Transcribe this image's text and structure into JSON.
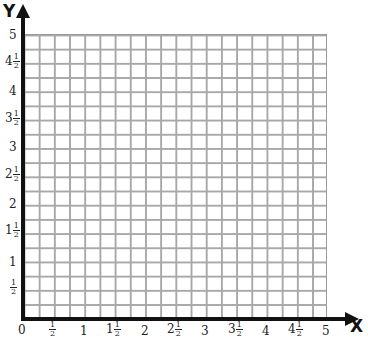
{
  "axes": {
    "x_label": "X",
    "y_label": "Y",
    "origin_label": "0"
  },
  "grid": {
    "columns": 20,
    "rows": 20,
    "x_range": [
      0,
      5
    ],
    "y_range": [
      0,
      5
    ],
    "cell_value": 0.25,
    "line_color": "#a8a8a8",
    "axis_color": "#111111"
  },
  "x_ticks": [
    {
      "whole": "",
      "num": "1",
      "den": "2",
      "x": 53
    },
    {
      "whole": "1",
      "num": "",
      "den": "",
      "x": 84
    },
    {
      "whole": "1",
      "num": "1",
      "den": "2",
      "x": 114
    },
    {
      "whole": "2",
      "num": "",
      "den": "",
      "x": 145
    },
    {
      "whole": "2",
      "num": "1",
      "den": "2",
      "x": 175
    },
    {
      "whole": "3",
      "num": "",
      "den": "",
      "x": 205
    },
    {
      "whole": "3",
      "num": "1",
      "den": "2",
      "x": 236
    },
    {
      "whole": "4",
      "num": "",
      "den": "",
      "x": 266
    },
    {
      "whole": "4",
      "num": "1",
      "den": "2",
      "x": 296
    },
    {
      "whole": "5",
      "num": "",
      "den": "",
      "x": 326
    }
  ],
  "y_ticks": [
    {
      "whole": "5",
      "num": "",
      "den": "",
      "y": 35
    },
    {
      "whole": "4",
      "num": "1",
      "den": "2",
      "y": 63
    },
    {
      "whole": "4",
      "num": "",
      "den": "",
      "y": 91
    },
    {
      "whole": "3",
      "num": "1",
      "den": "2",
      "y": 120
    },
    {
      "whole": "3",
      "num": "",
      "den": "",
      "y": 147
    },
    {
      "whole": "2",
      "num": "1",
      "den": "2",
      "y": 176
    },
    {
      "whole": "2",
      "num": "",
      "den": "",
      "y": 204
    },
    {
      "whole": "1",
      "num": "1",
      "den": "2",
      "y": 232
    },
    {
      "whole": "1",
      "num": "",
      "den": "",
      "y": 262
    },
    {
      "whole": "",
      "num": "1",
      "den": "2",
      "y": 289
    }
  ]
}
